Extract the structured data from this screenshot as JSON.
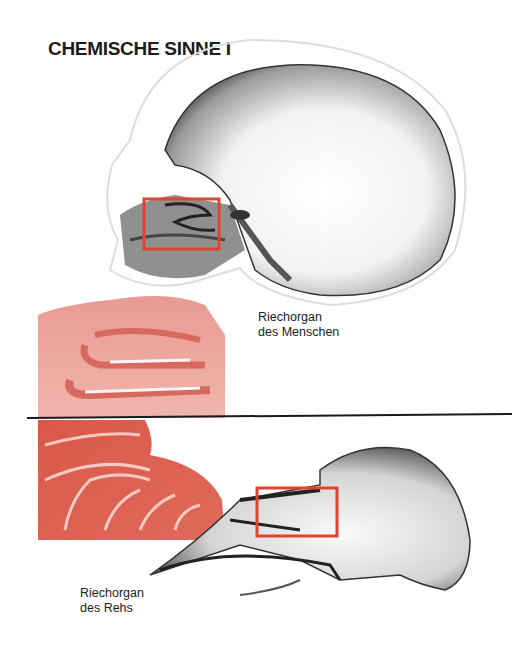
{
  "page": {
    "title": "CHEMISCHE SINNE I"
  },
  "figures": [
    {
      "id": "human",
      "caption_line1": "Riechorgan",
      "caption_line2": "des Menschen",
      "highlight_color": "#e0442e",
      "detail_color": "#e8837a"
    },
    {
      "id": "roe-deer",
      "caption_line1": "Riechorgan",
      "caption_line2": "des Rehs",
      "highlight_color": "#e0442e",
      "detail_color": "#d9574a"
    }
  ],
  "divider": {
    "color": "#1a1a1a"
  }
}
